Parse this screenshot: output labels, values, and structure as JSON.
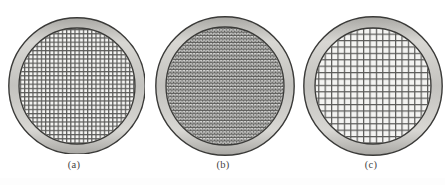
{
  "figure": {
    "title": "",
    "background_color": "#ffffff",
    "panel_count": 3
  },
  "style": {
    "ring_fill_light": "#d8d7d3",
    "ring_fill_mid": "#c4c3bf",
    "ring_fill_dark": "#a9a8a4",
    "ring_outline": "#3a3a38",
    "mesh_wire_color": "#5a5a58",
    "mesh_background": "#f4f4f2",
    "caption_color": "#45443f"
  },
  "panels": [
    {
      "id": "panel-a",
      "caption": "(a)",
      "mesh_type": "square-grid",
      "mesh_description": "fine square woven wire mesh",
      "outer_radius": 69,
      "ring_thickness": 11,
      "mesh_pitch": 4.2,
      "wire_width": 1.2,
      "center_x": 74,
      "center_y": 78
    },
    {
      "id": "panel-b",
      "caption": "(b)",
      "mesh_type": "staggered-brick",
      "mesh_description": "dense offset staggered mesh, rows shifted half a cell",
      "outer_radius": 70,
      "ring_thickness": 11,
      "mesh_pitch": 3.4,
      "wire_width": 1.0,
      "center_x": 74,
      "center_y": 78
    },
    {
      "id": "panel-c",
      "caption": "(c)",
      "mesh_type": "square-grid",
      "mesh_description": "coarse square woven wire mesh",
      "outer_radius": 70,
      "ring_thickness": 12,
      "mesh_pitch": 6.4,
      "wire_width": 1.2,
      "center_x": 74,
      "center_y": 78
    }
  ]
}
